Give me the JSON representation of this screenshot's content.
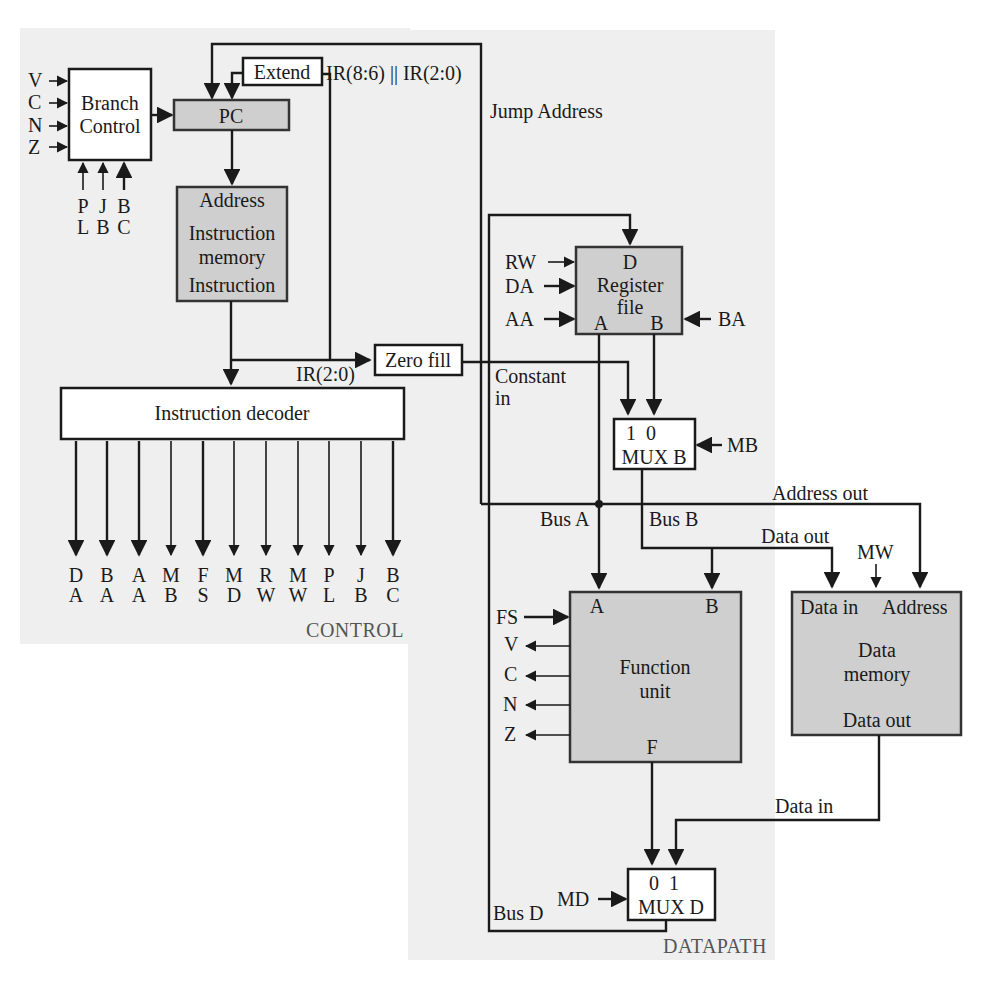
{
  "figure": {
    "sections": {
      "control": "CONTROL",
      "datapath": "DATAPATH"
    }
  },
  "control": {
    "branch_control": {
      "line1": "Branch",
      "line2": "Control",
      "inputs_left": [
        "V",
        "C",
        "N",
        "Z"
      ],
      "inputs_bottom": [
        {
          "top": "P",
          "bottom": "L"
        },
        {
          "top": "J",
          "bottom": "B"
        },
        {
          "top": "B",
          "bottom": "C"
        }
      ]
    },
    "pc": {
      "label": "PC"
    },
    "extend": {
      "label": "Extend"
    },
    "instruction_memory": {
      "line1": "Address",
      "line2": "Instruction",
      "line3": "memory",
      "line4": "Instruction"
    },
    "instruction_decoder": {
      "label": "Instruction decoder",
      "outputs": [
        {
          "top": "D",
          "bottom": "A"
        },
        {
          "top": "B",
          "bottom": "A"
        },
        {
          "top": "A",
          "bottom": "A"
        },
        {
          "top": "M",
          "bottom": "B"
        },
        {
          "top": "F",
          "bottom": "S"
        },
        {
          "top": "M",
          "bottom": "D"
        },
        {
          "top": "R",
          "bottom": "W"
        },
        {
          "top": "M",
          "bottom": "W"
        },
        {
          "top": "P",
          "bottom": "L"
        },
        {
          "top": "J",
          "bottom": "B"
        },
        {
          "top": "B",
          "bottom": "C"
        }
      ]
    },
    "zero_fill": {
      "label": "Zero fill"
    },
    "signals": {
      "ir_jump": "IR(8:6) || IR(2:0)",
      "jump_address": "Jump Address",
      "ir_low": "IR(2:0)"
    }
  },
  "datapath": {
    "register_file": {
      "d": "D",
      "line1": "Register",
      "line2": "file",
      "a": "A",
      "b": "B",
      "inputs": [
        "RW",
        "DA",
        "AA"
      ],
      "input_right": "BA"
    },
    "constant_in": {
      "line1": "Constant",
      "line2": "in"
    },
    "mux_b": {
      "sel": "1  0",
      "label": "MUX B",
      "control": "MB"
    },
    "buses": {
      "a": "Bus A",
      "b": "Bus B",
      "d": "Bus D"
    },
    "address_out": "Address out",
    "data_out": "Data out",
    "data_in": "Data in",
    "function_unit": {
      "a": "A",
      "b": "B",
      "line1": "Function",
      "line2": "unit",
      "f": "F",
      "control": "FS",
      "flags": [
        "V",
        "C",
        "N",
        "Z"
      ]
    },
    "data_memory": {
      "data_in": "Data in",
      "address": "Address",
      "line1": "Data",
      "line2": "memory",
      "data_out": "Data out",
      "control": "MW"
    },
    "mux_d": {
      "sel": "0  1",
      "label": "MUX D",
      "control": "MD"
    }
  }
}
